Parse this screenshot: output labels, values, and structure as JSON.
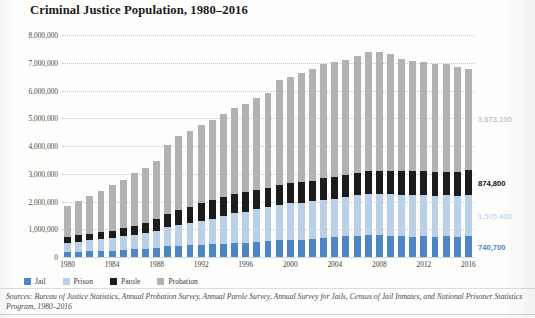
{
  "figure": {
    "title": "Criminal Justice Population, 1980–2016"
  },
  "legend": {
    "items": [
      {
        "label": "Jail",
        "color": "#4e85c5",
        "swatch_name": "legend-swatch-jail"
      },
      {
        "label": "Prison",
        "color": "#b9d0e6",
        "swatch_name": "legend-swatch-prison"
      },
      {
        "label": "Parole",
        "color": "#1c1c1c",
        "swatch_name": "legend-swatch-parole"
      },
      {
        "label": "Probation",
        "color": "#b2b2b2",
        "swatch_name": "legend-swatch-probation"
      }
    ]
  },
  "callouts": [
    {
      "value": "3,673,100",
      "series": "Probation",
      "color": "#b0b0b0"
    },
    {
      "value": "874,800",
      "series": "Parole",
      "color": "#111111"
    },
    {
      "value": "1,505,400",
      "series": "Prison",
      "color": "#b7cfe4"
    },
    {
      "value": "740,700",
      "series": "Jail",
      "color": "#4e85c5"
    }
  ],
  "sources": {
    "text": "Sources: Bureau of Justice Statistics, Annual Probation Survey, Annual Parole Survey, Annual Survey for Jails, Census of Jail Inmates, and National Prisoner Statistics Program, 1980–2016"
  },
  "chart_data": {
    "type": "bar",
    "stacked": true,
    "title": "Criminal Justice Population, 1980–2016",
    "xlabel": "",
    "ylabel": "",
    "ylim": [
      0,
      8000000
    ],
    "ytick_labels": [
      "0",
      "1,000,000",
      "2,000,000",
      "3,000,000",
      "4,000,000",
      "5,000,000",
      "6,000,000",
      "7,000,000",
      "8,000,000"
    ],
    "ytick_values": [
      0,
      1000000,
      2000000,
      3000000,
      4000000,
      5000000,
      6000000,
      7000000,
      8000000
    ],
    "grid": true,
    "grid_style": "dotted-horizontal",
    "legend_position": "below-plot-left",
    "x": [
      1980,
      1981,
      1982,
      1983,
      1984,
      1985,
      1986,
      1987,
      1988,
      1989,
      1990,
      1991,
      1992,
      1993,
      1994,
      1995,
      1996,
      1997,
      1998,
      1999,
      2000,
      2001,
      2002,
      2003,
      2004,
      2005,
      2006,
      2007,
      2008,
      2009,
      2010,
      2011,
      2012,
      2013,
      2014,
      2015,
      2016
    ],
    "xtick_labels": [
      "1980",
      "1984",
      "1988",
      "1992",
      "1996",
      "2000",
      "2004",
      "2008",
      "2012",
      "2016"
    ],
    "xtick_values": [
      1980,
      1984,
      1988,
      1992,
      1996,
      2000,
      2004,
      2008,
      2012,
      2016
    ],
    "series": [
      {
        "name": "Jail",
        "color": "#4e85c5",
        "stack_order": 1,
        "end_label": "740,700",
        "values": [
          182300,
          195100,
          207900,
          221800,
          233000,
          254900,
          272700,
          294000,
          341800,
          393300,
          403000,
          424100,
          441800,
          455500,
          479800,
          499300,
          510400,
          557900,
          584400,
          596500,
          613500,
          625900,
          652100,
          691300,
          713990,
          747500,
          765800,
          780200,
          785500,
          767400,
          748700,
          735600,
          744500,
          731200,
          744600,
          728200,
          740700
        ]
      },
      {
        "name": "Prison",
        "color": "#b9d0e6",
        "stack_order": 2,
        "end_label": "1,505,400",
        "values": [
          319600,
          360000,
          402900,
          423900,
          448300,
          487600,
          526400,
          562800,
          607000,
          683400,
          743000,
          792500,
          850600,
          909400,
          990100,
          1078500,
          1127500,
          1176600,
          1224500,
          1287200,
          1316300,
          1330100,
          1353200,
          1375600,
          1392300,
          1421900,
          1461100,
          1483900,
          1495900,
          1507800,
          1500600,
          1501600,
          1483900,
          1479400,
          1479600,
          1476800,
          1505400
        ]
      },
      {
        "name": "Parole",
        "color": "#1c1c1c",
        "stack_order": 3,
        "end_label": "874,800",
        "values": [
          220400,
          225500,
          224600,
          246400,
          266900,
          300200,
          325600,
          355500,
          407900,
          456800,
          531400,
          590400,
          658600,
          676100,
          690200,
          700200,
          704700,
          694800,
          696400,
          714700,
          725500,
          732300,
          750900,
          769900,
          775900,
          784400,
          798200,
          824400,
          828200,
          824600,
          840700,
          854300,
          858400,
          850200,
          857700,
          870500,
          874800
        ]
      },
      {
        "name": "Probation",
        "color": "#b2b2b2",
        "stack_order": 4,
        "end_label": "3,673,100",
        "values": [
          1118100,
          1225900,
          1357300,
          1494000,
          1637000,
          1740000,
          1890000,
          2000000,
          2100000,
          2520000,
          2670000,
          2730000,
          2810000,
          2900000,
          2980000,
          3080000,
          3160000,
          3300000,
          3417000,
          3780000,
          3840000,
          3930000,
          4024000,
          4120000,
          4140000,
          4160000,
          4230000,
          4290000,
          4270000,
          4200000,
          4060000,
          3970000,
          3940000,
          3910000,
          3870000,
          3790000,
          3673100
        ]
      }
    ],
    "totals": [
      1840400,
      2006500,
      2192700,
      2386100,
      2585200,
      2782700,
      3014700,
      3212300,
      3456700,
      4053500,
      4347400,
      4537000,
      4761000,
      4941000,
      5140100,
      5358000,
      5502600,
      5729300,
      5922300,
      6378400,
      6495300,
      6618300,
      6780200,
      6956800,
      7022190,
      7113800,
      7255100,
      7378500,
      7379600,
      7299800,
      7150000,
      7061500,
      7026800,
      6970800,
      6951900,
      6865500,
      6794000
    ]
  }
}
